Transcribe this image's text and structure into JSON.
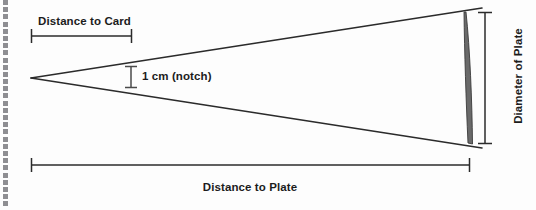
{
  "figure": {
    "title_text": "",
    "background_color": "#fdfdfd",
    "line_color": "#2b2b2b",
    "plate_fill_color": "#6a6a6a",
    "plate_edge_color": "#3a3a3a",
    "dot_color": "#8e8e92",
    "text_color": "#1c1c1c"
  },
  "labels": {
    "distance_to_card": "Distance to Card",
    "notch": "1 cm (notch)",
    "distance_to_plate": "Distance to Plate",
    "diameter_of_plate": "Diameter of Plate"
  },
  "geometry": {
    "apex_x": 31,
    "apex_y": 78,
    "cone_right_x": 482,
    "cone_top_right_y": 8,
    "cone_bottom_right_y": 148,
    "plate_left_x": 464,
    "plate_right_x": 473,
    "plate_top_y": 12,
    "plate_bottom_y": 144,
    "card_bracket_x1": 31,
    "card_bracket_x2": 132,
    "card_bracket_y": 36,
    "notch_bracket_x": 131,
    "notch_bracket_y1": 66,
    "notch_bracket_y2": 88,
    "plate_bracket_x1": 31,
    "plate_bracket_x2": 470,
    "plate_bracket_y": 165,
    "diameter_bracket_x": 485,
    "diameter_bracket_y1": 12,
    "diameter_bracket_y2": 144
  },
  "dot_rail": {
    "dot_count": 29,
    "dot_size_px": 5
  },
  "chart_data": {
    "type": "diagram",
    "measurements": [
      {
        "name": "Distance to Card",
        "orientation": "horizontal",
        "from": [
          31,
          36
        ],
        "to": [
          132,
          36
        ]
      },
      {
        "name": "1 cm (notch)",
        "orientation": "vertical",
        "from": [
          131,
          66
        ],
        "to": [
          131,
          88
        ],
        "value": 1,
        "unit": "cm"
      },
      {
        "name": "Distance to Plate",
        "orientation": "horizontal",
        "from": [
          31,
          165
        ],
        "to": [
          470,
          165
        ]
      },
      {
        "name": "Diameter of Plate",
        "orientation": "vertical",
        "from": [
          485,
          12
        ],
        "to": [
          485,
          144
        ]
      }
    ]
  }
}
